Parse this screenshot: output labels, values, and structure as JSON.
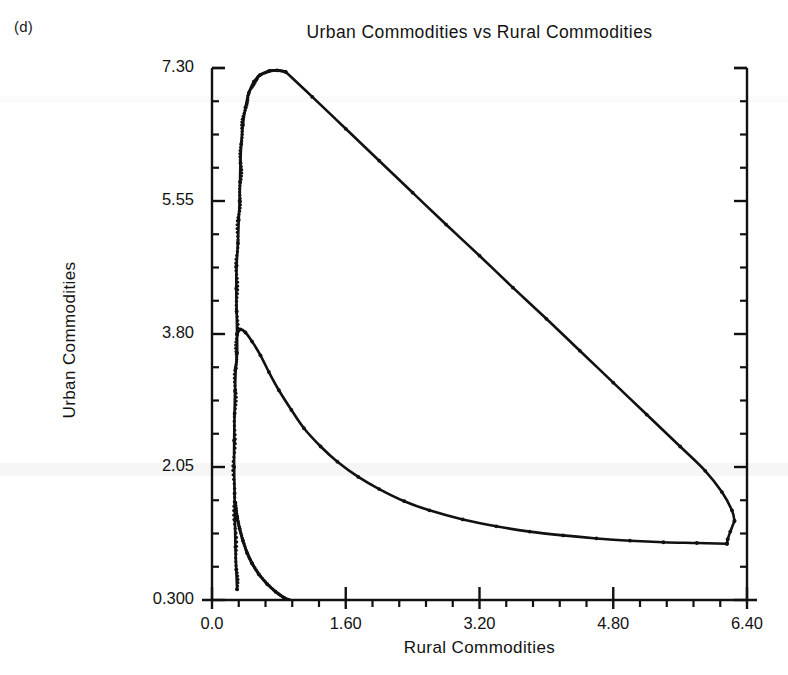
{
  "figure": {
    "panel_label": "(d)",
    "title": "Urban Commodities vs Rural Commodities",
    "ink_color": "#111111",
    "background_color": "#ffffff"
  },
  "chart_data": {
    "type": "line",
    "title": "Urban Commodities vs Rural Commodities",
    "xlabel": "Rural Commodities",
    "ylabel": "Urban Commodities",
    "xlim": [
      0.0,
      6.4
    ],
    "ylim": [
      0.3,
      7.3
    ],
    "xticks": [
      0.0,
      1.6,
      3.2,
      4.8,
      6.4
    ],
    "xtick_labels": [
      "0.0",
      "1.60",
      "3.20",
      "4.80",
      "6.40"
    ],
    "yticks": [
      0.3,
      2.05,
      3.8,
      5.55,
      7.3
    ],
    "ytick_labels": [
      "0.300",
      "2.05",
      "3.80",
      "5.55",
      "7.30"
    ],
    "x_minor_per_major": 5,
    "y_minor_per_major": 4,
    "grid": false,
    "legend": null,
    "axis_style": "left-and-right-spines-with-inward-ticks",
    "marker": "small-dot",
    "series": [
      {
        "name": "trajectory-rising-branch",
        "comment": "dense near-vertical ascent of orbit at low Rural Commodities",
        "points": [
          [
            0.3,
            0.44
          ],
          [
            0.29,
            0.7
          ],
          [
            0.28,
            1.0
          ],
          [
            0.275,
            1.35
          ],
          [
            0.27,
            1.7
          ],
          [
            0.265,
            2.05
          ],
          [
            0.265,
            2.4
          ],
          [
            0.27,
            2.75
          ],
          [
            0.275,
            3.05
          ],
          [
            0.285,
            3.35
          ],
          [
            0.3,
            3.55
          ],
          [
            0.3,
            3.8
          ],
          [
            0.295,
            4.1
          ],
          [
            0.29,
            4.4
          ],
          [
            0.295,
            4.7
          ],
          [
            0.31,
            5.0
          ],
          [
            0.32,
            5.3
          ],
          [
            0.33,
            5.55
          ],
          [
            0.335,
            5.8
          ],
          [
            0.34,
            6.05
          ],
          [
            0.35,
            6.3
          ],
          [
            0.37,
            6.55
          ],
          [
            0.4,
            6.78
          ],
          [
            0.44,
            6.97
          ],
          [
            0.5,
            7.12
          ],
          [
            0.58,
            7.21
          ],
          [
            0.68,
            7.26
          ],
          [
            0.78,
            7.27
          ],
          [
            0.88,
            7.25
          ]
        ]
      },
      {
        "name": "trajectory-descending-line",
        "comment": "long near-linear fall from peak to right edge",
        "points": [
          [
            0.88,
            7.25
          ],
          [
            1.2,
            6.92
          ],
          [
            1.6,
            6.5
          ],
          [
            2.0,
            6.08
          ],
          [
            2.4,
            5.66
          ],
          [
            2.8,
            5.24
          ],
          [
            3.2,
            4.83
          ],
          [
            3.6,
            4.41
          ],
          [
            4.0,
            4.0
          ],
          [
            4.4,
            3.58
          ],
          [
            4.8,
            3.16
          ],
          [
            5.2,
            2.74
          ],
          [
            5.6,
            2.32
          ],
          [
            5.9,
            2.0
          ],
          [
            6.1,
            1.72
          ],
          [
            6.22,
            1.48
          ],
          [
            6.25,
            1.34
          ]
        ]
      },
      {
        "name": "trajectory-right-drop",
        "comment": "sharp vertical drop at the right edge closing the orbit",
        "points": [
          [
            6.25,
            1.34
          ],
          [
            6.2,
            1.2
          ],
          [
            6.17,
            1.1
          ],
          [
            6.16,
            1.04
          ]
        ]
      },
      {
        "name": "trajectory-lower-decay",
        "comment": "slow decay branch returning leftward along the bottom",
        "points": [
          [
            6.16,
            1.04
          ],
          [
            5.8,
            1.05
          ],
          [
            5.4,
            1.06
          ],
          [
            5.0,
            1.08
          ],
          [
            4.6,
            1.11
          ],
          [
            4.2,
            1.15
          ],
          [
            3.8,
            1.2
          ],
          [
            3.4,
            1.27
          ],
          [
            3.0,
            1.36
          ],
          [
            2.6,
            1.48
          ],
          [
            2.3,
            1.6
          ],
          [
            2.0,
            1.76
          ],
          [
            1.75,
            1.92
          ],
          [
            1.5,
            2.12
          ],
          [
            1.3,
            2.32
          ],
          [
            1.1,
            2.56
          ],
          [
            0.95,
            2.8
          ],
          [
            0.8,
            3.06
          ],
          [
            0.68,
            3.3
          ],
          [
            0.58,
            3.52
          ],
          [
            0.48,
            3.7
          ],
          [
            0.4,
            3.82
          ],
          [
            0.34,
            3.86
          ],
          [
            0.3,
            3.8
          ]
        ]
      },
      {
        "name": "trajectory-lower-exit",
        "comment": "branch falling from the dense column down to the x-axis",
        "points": [
          [
            0.28,
            1.58
          ],
          [
            0.3,
            1.4
          ],
          [
            0.33,
            1.24
          ],
          [
            0.37,
            1.08
          ],
          [
            0.42,
            0.92
          ],
          [
            0.48,
            0.78
          ],
          [
            0.56,
            0.64
          ],
          [
            0.66,
            0.51
          ],
          [
            0.76,
            0.41
          ],
          [
            0.86,
            0.33
          ],
          [
            0.92,
            0.3
          ]
        ]
      }
    ]
  }
}
